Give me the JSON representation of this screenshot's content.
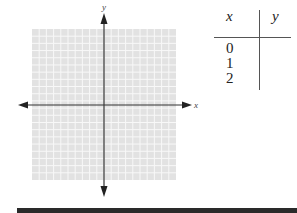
{
  "chart_data": {
    "type": "coordinate-plane",
    "axes": {
      "x_label": "x",
      "y_label": "y"
    },
    "grid": {
      "columns": 20,
      "rows": 21,
      "visible": true,
      "color": "#e2e2e2"
    },
    "arrows": true
  },
  "table": {
    "headers": {
      "x": "x",
      "y": "y"
    },
    "rows": [
      {
        "x": "0",
        "y": ""
      },
      {
        "x": "1",
        "y": ""
      },
      {
        "x": "2",
        "y": ""
      }
    ]
  },
  "colors": {
    "grid_bg": "#e2e2e2",
    "grid_line": "#f8f8f8",
    "axis": "#333333",
    "bar": "#2a2a2a"
  }
}
